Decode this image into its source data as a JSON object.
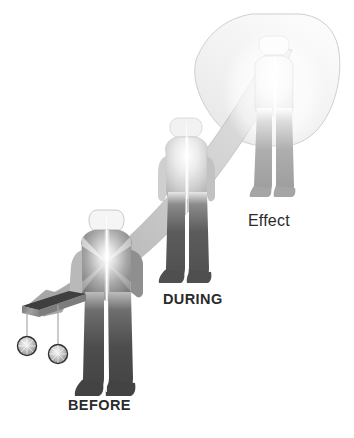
{
  "figure": {
    "background_color": "#ffffff",
    "width": 354,
    "height": 438
  },
  "labels": {
    "before": "BEFORE",
    "during": "DURING",
    "effect": "Effect"
  },
  "palette": {
    "background": "#ffffff",
    "figure_dark": "#4a4a4a",
    "figure_mid": "#8d8d8d",
    "figure_light": "#d6d6d6",
    "highlight": "#ffffff",
    "outline": "#9a9a9a",
    "ribbon_gray": "#b8b8b8",
    "ribbon_pale": "#efefef",
    "plank_top": "#3f3f3f",
    "plank_face": "#8f8f8f",
    "weight_sphere": "#b5b5b5",
    "weight_outline": "#2e2e2e",
    "string": "#a8a8a8",
    "text": "#2b2b2b"
  },
  "elements": {
    "figures": [
      {
        "name": "before-figure",
        "stage": "BEFORE",
        "brightness": "dark torso with radial burst highlight, dark legs"
      },
      {
        "name": "during-figure",
        "stage": "DURING",
        "brightness": "light torso, medium-dark legs"
      },
      {
        "name": "effect-figure",
        "stage": "Effect",
        "brightness": "nearly faded white torso, light gray legs"
      }
    ],
    "ribbon": {
      "name": "sweep-ribbon",
      "description": "gray band sweeping diagonally from lower-left plank up past the figures"
    },
    "banner": {
      "name": "upper-banner",
      "description": "large pale curved banner behind the Effect figure"
    },
    "plank": {
      "name": "support-plank",
      "description": "angled 3D bar at lower left"
    },
    "weights": [
      {
        "name": "weight-sphere-left"
      },
      {
        "name": "weight-sphere-right"
      }
    ]
  }
}
